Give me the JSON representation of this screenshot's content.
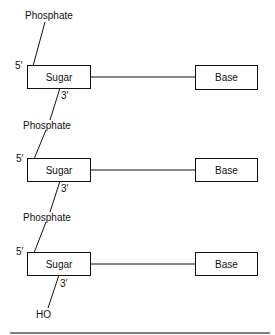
{
  "diagram": {
    "units": [
      {
        "phosphate": "Phosphate",
        "five_prime": "5′",
        "sugar": "Sugar",
        "base": "Base",
        "three_prime": "3′"
      },
      {
        "phosphate": "Phosphate",
        "five_prime": "5′",
        "sugar": "Sugar",
        "base": "Base",
        "three_prime": "3′"
      },
      {
        "phosphate": "Phosphate",
        "five_prime": "5′",
        "sugar": "Sugar",
        "base": "Base",
        "three_prime": "3′"
      }
    ],
    "terminal": "HO"
  }
}
